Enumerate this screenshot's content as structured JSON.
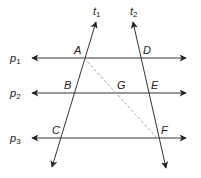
{
  "diagram": {
    "type": "parallel lines cut by transversals",
    "colors": {
      "line": "#222222",
      "dashed": "#a8a8a8",
      "background": "#ffffff"
    },
    "parallel_lines": [
      {
        "id": "p1",
        "label": "p",
        "subscript": "1",
        "y": 58
      },
      {
        "id": "p2",
        "label": "p",
        "subscript": "2",
        "y": 93
      },
      {
        "id": "p3",
        "label": "p",
        "subscript": "3",
        "y": 138
      }
    ],
    "transversals": [
      {
        "id": "t1",
        "label": "t",
        "subscript": "1"
      },
      {
        "id": "t2",
        "label": "t",
        "subscript": "2"
      }
    ],
    "points": [
      {
        "name": "A"
      },
      {
        "name": "B"
      },
      {
        "name": "C"
      },
      {
        "name": "D"
      },
      {
        "name": "E"
      },
      {
        "name": "F"
      },
      {
        "name": "G"
      }
    ],
    "dashed_segment": "AF"
  }
}
